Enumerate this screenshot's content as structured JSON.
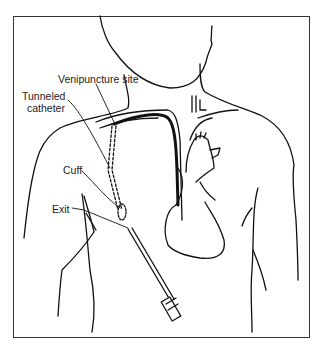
{
  "diagram": {
    "labels": {
      "venipuncture": "Venipuncture site",
      "tunneled_line1": "Tunneled",
      "tunneled_line2": "catheter",
      "cuff": "Cuff",
      "exit": "Exit"
    },
    "colors": {
      "line": "#111111",
      "frame": "#333333",
      "background": "#ffffff"
    }
  }
}
